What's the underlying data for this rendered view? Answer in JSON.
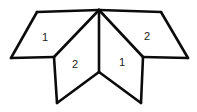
{
  "figure": {
    "background_color": "#ffffff",
    "line_color": "#0b0b0b",
    "label_color": "#1a1a1a",
    "line_width": 2.6,
    "vertices": {
      "apex": [
        99,
        10
      ],
      "top_left": [
        37,
        12
      ],
      "far_left": [
        11,
        58
      ],
      "left_junction": [
        54,
        57
      ],
      "top_right": [
        161,
        12
      ],
      "far_right": [
        188,
        58
      ],
      "right_junction": [
        143,
        57
      ],
      "center_branch": [
        99,
        72
      ],
      "bottom_left": [
        57,
        103
      ],
      "bottom_right": [
        141,
        103
      ]
    },
    "panels": [
      {
        "id": "upper-left-panel",
        "label": "1",
        "label_pos": [
          45,
          38
        ],
        "points": "37,12 99,10 54,57 11,58"
      },
      {
        "id": "upper-right-panel",
        "label": "2",
        "label_pos": [
          147,
          37
        ],
        "points": "99,10 161,12 188,58 143,57"
      },
      {
        "id": "lower-left-panel",
        "label": "2",
        "label_pos": [
          75,
          65
        ],
        "points": "99,10 99,72 57,103 54,57"
      },
      {
        "id": "lower-right-panel",
        "label": "1",
        "label_pos": [
          122,
          63
        ],
        "points": "99,10 143,57 141,103 99,72"
      }
    ],
    "edges": [
      {
        "id": "top-left-edge",
        "d": "M 37,12 L 99,10"
      },
      {
        "id": "top-right-edge",
        "d": "M 99,10 L 161,12"
      },
      {
        "id": "left-outer-upper-edge",
        "d": "M 37,12 L 11,58"
      },
      {
        "id": "left-outer-lower-edge",
        "d": "M 11,58 L 54,57"
      },
      {
        "id": "right-outer-upper-edge",
        "d": "M 161,12 L 188,58"
      },
      {
        "id": "right-outer-lower-edge",
        "d": "M 188,58 L 143,57"
      },
      {
        "id": "left-fold-diagonal",
        "d": "M 99,10 L 54,57"
      },
      {
        "id": "right-fold-diagonal",
        "d": "M 99,10 L 143,57"
      },
      {
        "id": "center-vertical-fold",
        "d": "M 99,10 L 99,72"
      },
      {
        "id": "left-leg-outer-edge",
        "d": "M 54,57 L 57,103"
      },
      {
        "id": "right-leg-outer-edge",
        "d": "M 143,57 L 141,103"
      },
      {
        "id": "left-leg-bottom-edge",
        "d": "M 57,103 L 99,72"
      },
      {
        "id": "right-leg-bottom-edge",
        "d": "M 99,72 L 141,103"
      }
    ]
  }
}
